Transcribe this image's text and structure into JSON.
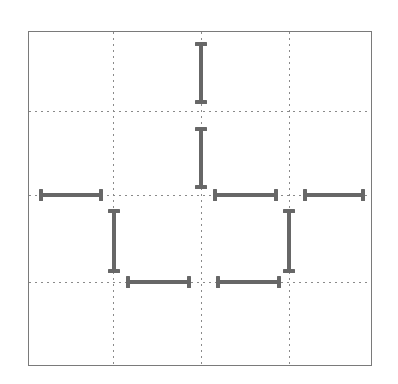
{
  "figure": {
    "title": "",
    "background_color": "#ffffff",
    "frame_color": "#7a7a7a",
    "series_color": "#676767",
    "grid_color": "#8a8a8a"
  },
  "chart_data": {
    "type": "line",
    "title": "",
    "xlabel": "",
    "ylabel": "",
    "xlim": [
      0,
      4
    ],
    "ylim": [
      0,
      4
    ],
    "grid": true,
    "grid_style": "dotted",
    "legend": null,
    "xticks": [
      1,
      2,
      3
    ],
    "xticklabels": [
      "",
      "",
      ""
    ],
    "yticks": [
      1,
      2,
      3
    ],
    "yticklabels": [
      "",
      "",
      ""
    ],
    "segments": [
      {
        "id": "v-top",
        "orientation": "vertical",
        "x": 2.0,
        "y0": 3.1,
        "y1": 2.38
      },
      {
        "id": "v-upper-mid",
        "orientation": "vertical",
        "x": 2.0,
        "y0": 2.15,
        "y1": 1.43
      },
      {
        "id": "h-left",
        "orientation": "horizontal",
        "y": 1.35,
        "x0": 0.12,
        "x1": 0.86
      },
      {
        "id": "h-center",
        "orientation": "horizontal",
        "y": 1.35,
        "x0": 2.13,
        "x1": 2.88
      },
      {
        "id": "h-right",
        "orientation": "horizontal",
        "y": 1.35,
        "x0": 3.16,
        "x1": 3.9
      },
      {
        "id": "v-lower-left",
        "orientation": "vertical",
        "x": 1.0,
        "y0": 1.18,
        "y1": 0.43
      },
      {
        "id": "v-lower-right",
        "orientation": "vertical",
        "x": 3.0,
        "y0": 1.18,
        "y1": 0.43
      },
      {
        "id": "h-bottom-left",
        "orientation": "horizontal",
        "y": 0.32,
        "x0": 1.14,
        "x1": 1.88
      },
      {
        "id": "h-bottom-right",
        "orientation": "horizontal",
        "y": 0.32,
        "x0": 2.16,
        "x1": 2.9
      }
    ],
    "series": [
      {
        "name": "step",
        "x": [
          0.12,
          0.86,
          1.0,
          1.0,
          1.14,
          1.88,
          2.0,
          2.0,
          2.13,
          2.88,
          3.0,
          3.0,
          3.16,
          3.9
        ],
        "y": [
          1.35,
          1.35,
          1.18,
          0.43,
          0.32,
          0.32,
          2.15,
          3.1,
          1.35,
          1.35,
          1.18,
          0.43,
          1.35,
          1.35
        ]
      }
    ]
  },
  "segments_px": [
    {
      "name": "segment-v-top",
      "type": "v",
      "left": 170,
      "top": 10,
      "length": 62
    },
    {
      "name": "segment-v-upper-mid",
      "type": "v",
      "left": 170,
      "top": 95,
      "length": 62
    },
    {
      "name": "segment-h-left",
      "type": "h",
      "left": 10,
      "top": 161,
      "length": 64
    },
    {
      "name": "segment-h-center",
      "type": "h",
      "left": 184,
      "top": 161,
      "length": 65
    },
    {
      "name": "segment-h-right",
      "type": "h",
      "left": 274,
      "top": 161,
      "length": 62
    },
    {
      "name": "segment-v-lower-left",
      "type": "v",
      "left": 83,
      "top": 177,
      "length": 64
    },
    {
      "name": "segment-v-lower-right",
      "type": "v",
      "left": 258,
      "top": 177,
      "length": 64
    },
    {
      "name": "segment-h-bottom-left",
      "type": "h",
      "left": 97,
      "top": 248,
      "length": 65
    },
    {
      "name": "segment-h-bottom-right",
      "type": "h",
      "left": 187,
      "top": 248,
      "length": 65
    }
  ],
  "gridlines_px": {
    "vertical": [
      84,
      172,
      260
    ],
    "horizontal": [
      79,
      163,
      250
    ]
  }
}
